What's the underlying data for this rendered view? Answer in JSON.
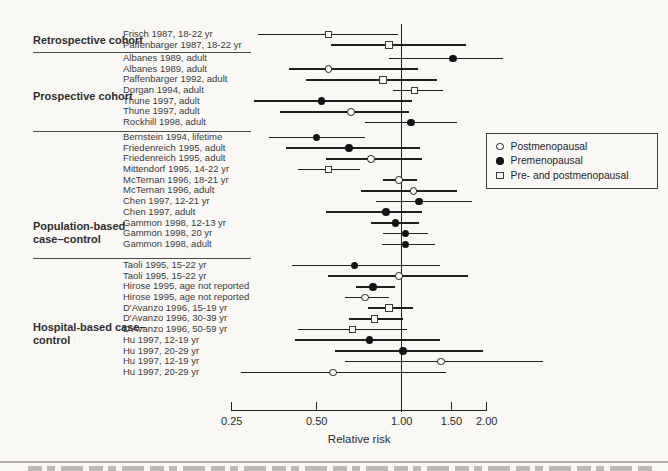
{
  "figure": {
    "axis": {
      "label": "Relative risk",
      "scale": "log",
      "range": [
        0.25,
        2.0
      ],
      "reference_line": 1.0,
      "ticks": [
        {
          "value": 0.25,
          "label": "0.25"
        },
        {
          "value": 0.5,
          "label": "0.50"
        },
        {
          "value": 1.0,
          "label": "1.00"
        },
        {
          "value": 1.5,
          "label": "1.50"
        },
        {
          "value": 2.0,
          "label": "2.00"
        }
      ]
    },
    "legend": {
      "items": [
        {
          "marker": "open-circle",
          "label": "Postmenopausal"
        },
        {
          "marker": "filled-circle",
          "label": "Premenopausal"
        },
        {
          "marker": "open-square",
          "label": "Pre- and postmenopausal"
        }
      ]
    }
  },
  "chart_data": {
    "type": "scatter",
    "subtype": "forest-plot",
    "xlabel": "Relative risk",
    "x_scale": "log",
    "x_ticks": [
      0.25,
      0.5,
      1.0,
      1.5,
      2.0
    ],
    "reference_line_x": 1.0,
    "marker_legend": {
      "open-circle": "Postmenopausal",
      "filled-circle": "Premenopausal",
      "open-square": "Pre- and postmenopausal"
    },
    "groups": [
      {
        "name": "Retrospective cohort",
        "studies": [
          {
            "label": "Frisch 1987, 18-22 yr",
            "marker": "open-square",
            "rr": 0.55,
            "ci": [
              0.31,
              0.97
            ]
          },
          {
            "label": "Paffenbarger 1987, 18-22 yr",
            "marker": "open-square",
            "rr": 0.9,
            "ci": [
              0.56,
              1.69
            ]
          }
        ]
      },
      {
        "name": "Prospective cohort",
        "studies": [
          {
            "label": "Albanes 1989, adult",
            "marker": "filled-circle",
            "rr": 1.52,
            "ci": [
              0.9,
              2.29
            ]
          },
          {
            "label": "Albanes 1989, adult",
            "marker": "open-circle",
            "rr": 0.55,
            "ci": [
              0.4,
              1.14
            ]
          },
          {
            "label": "Paffenbarger 1992, adult",
            "marker": "open-square",
            "rr": 0.86,
            "ci": [
              0.46,
              1.33
            ]
          },
          {
            "label": "Dorgan 1994, adult",
            "marker": "open-square",
            "rr": 1.11,
            "ci": [
              0.93,
              1.4
            ]
          },
          {
            "label": "Thune 1997, adult",
            "marker": "filled-circle",
            "rr": 0.52,
            "ci": [
              0.3,
              1.09
            ]
          },
          {
            "label": "Thune 1997, adult",
            "marker": "open-circle",
            "rr": 0.66,
            "ci": [
              0.37,
              1.06
            ]
          },
          {
            "label": "Rockhill 1998, adult",
            "marker": "filled-circle",
            "rr": 1.08,
            "ci": [
              0.74,
              1.57
            ]
          }
        ]
      },
      {
        "name": "Population-based case–control",
        "studies": [
          {
            "label": "Bernstein 1994, lifetime",
            "marker": "filled-circle",
            "rr": 0.5,
            "ci": [
              0.34,
              0.74
            ]
          },
          {
            "label": "Friedenreich 1995, adult",
            "marker": "filled-circle",
            "rr": 0.65,
            "ci": [
              0.39,
              1.16
            ]
          },
          {
            "label": "Friedenreich 1995, adult",
            "marker": "open-circle",
            "rr": 0.78,
            "ci": [
              0.54,
              1.18
            ]
          },
          {
            "label": "Mittendorf 1995, 14-22 yr",
            "marker": "open-square",
            "rr": 0.55,
            "ci": [
              0.43,
              0.71
            ]
          },
          {
            "label": "McTernan 1996, 18-21 yr",
            "marker": "open-circle",
            "rr": 0.98,
            "ci": [
              0.86,
              1.13
            ]
          },
          {
            "label": "McTernan 1996, adult",
            "marker": "open-circle",
            "rr": 1.1,
            "ci": [
              0.72,
              1.57
            ]
          },
          {
            "label": "Chen 1997, 12-21 yr",
            "marker": "filled-circle",
            "rr": 1.15,
            "ci": [
              0.81,
              1.77
            ]
          },
          {
            "label": "Chen 1997, adult",
            "marker": "filled-circle",
            "rr": 0.88,
            "ci": [
              0.54,
              1.18
            ]
          },
          {
            "label": "Gammon 1998, 12-13 yr",
            "marker": "filled-circle",
            "rr": 0.95,
            "ci": [
              0.78,
              1.15
            ]
          },
          {
            "label": "Gammon 1998, 20 yr",
            "marker": "filled-circle",
            "rr": 1.03,
            "ci": [
              0.86,
              1.24
            ]
          },
          {
            "label": "Gammon 1998, adult",
            "marker": "filled-circle",
            "rr": 1.03,
            "ci": [
              0.85,
              1.31
            ]
          }
        ]
      },
      {
        "name": "Hospital-based case–control",
        "studies": [
          {
            "label": "Taoli 1995, 15-22 yr",
            "marker": "filled-circle",
            "rr": 0.68,
            "ci": [
              0.41,
              1.37
            ]
          },
          {
            "label": "Taoli 1995, 15-22 yr",
            "marker": "open-circle",
            "rr": 0.98,
            "ci": [
              0.55,
              1.72
            ]
          },
          {
            "label": "Hirose 1995, age not reported",
            "marker": "filled-circle",
            "rr": 0.79,
            "ci": [
              0.69,
              0.95
            ]
          },
          {
            "label": "Hirose 1995, age not reported",
            "marker": "open-circle",
            "rr": 0.74,
            "ci": [
              0.63,
              0.9
            ]
          },
          {
            "label": "D'Avanzo 1996, 15-19 yr",
            "marker": "open-square",
            "rr": 0.9,
            "ci": [
              0.76,
              1.1
            ]
          },
          {
            "label": "D'Avanzo 1996, 30-39 yr",
            "marker": "open-square",
            "rr": 0.8,
            "ci": [
              0.65,
              1.01
            ]
          },
          {
            "label": "D'Avanzo 1996, 50-59 yr",
            "marker": "open-square",
            "rr": 0.67,
            "ci": [
              0.43,
              1.04
            ]
          },
          {
            "label": "Hu 1997, 12-19 yr",
            "marker": "filled-circle",
            "rr": 0.77,
            "ci": [
              0.42,
              1.37
            ]
          },
          {
            "label": "Hu 1997, 20-29 yr",
            "marker": "filled-circle",
            "rr": 1.01,
            "ci": [
              0.58,
              1.94
            ]
          },
          {
            "label": "Hu 1997, 12-19 yr",
            "marker": "open-circle",
            "rr": 1.38,
            "ci": [
              0.63,
              3.17
            ]
          },
          {
            "label": "Hu 1997, 20-29 yr",
            "marker": "open-circle",
            "rr": 0.57,
            "ci": [
              0.27,
              1.43
            ]
          }
        ]
      }
    ]
  }
}
